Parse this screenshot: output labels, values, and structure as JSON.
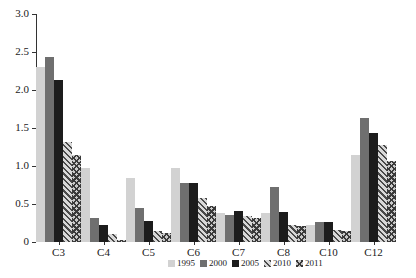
{
  "chart_data": {
    "type": "bar",
    "title": "",
    "subtitle": "",
    "xlabel": "",
    "ylabel": "",
    "categories": [
      "C3",
      "C4",
      "C5",
      "C6",
      "C7",
      "C8",
      "C10",
      "C12"
    ],
    "series": [
      {
        "name": "1995",
        "color": "#d2d2d2",
        "pattern": "solid",
        "values": [
          2.3,
          0.97,
          0.84,
          0.97,
          0.38,
          0.38,
          0.22,
          1.15
        ]
      },
      {
        "name": "2000",
        "color": "#6f6f6f",
        "pattern": "solid",
        "values": [
          2.44,
          0.31,
          0.45,
          0.77,
          0.36,
          0.73,
          0.26,
          1.63
        ]
      },
      {
        "name": "2005",
        "color": "#1c1c1c",
        "pattern": "solid",
        "values": [
          2.13,
          0.22,
          0.28,
          0.78,
          0.41,
          0.4,
          0.26,
          1.44
        ]
      },
      {
        "name": "2010",
        "color": "#4a4a4a",
        "pattern": "diagonal-hatch",
        "values": [
          1.32,
          0.1,
          0.14,
          0.58,
          0.34,
          0.22,
          0.16,
          1.28
        ]
      },
      {
        "name": "2011",
        "color": "#3a3a3a",
        "pattern": "cross-hatch",
        "values": [
          1.15,
          0.02,
          0.12,
          0.47,
          0.32,
          0.21,
          0.14,
          1.06
        ]
      }
    ],
    "ylim": [
      0,
      3.0
    ],
    "yticks": [
      0,
      0.5,
      1.0,
      1.5,
      2.0,
      2.5,
      3.0
    ],
    "ytick_labels": [
      "0",
      "0.5",
      "1.0",
      "1.5",
      "2.0",
      "2.5",
      "3.0"
    ],
    "grid": false,
    "legend_position": "bottom"
  }
}
